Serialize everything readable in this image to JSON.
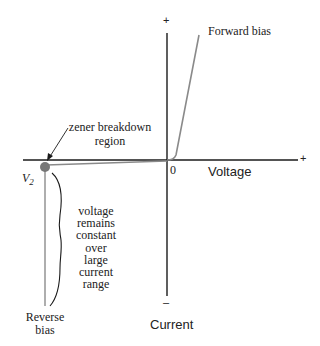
{
  "diagram": {
    "axes": {
      "x_label": "Voltage",
      "y_label": "Current",
      "x_plus": "+",
      "y_plus": "+",
      "y_minus": "–",
      "origin": "0"
    },
    "labels": {
      "forward_bias": "Forward bias",
      "reverse_bias_line1": "Reverse",
      "reverse_bias_line2": "bias",
      "zener_line1": "zener breakdown",
      "zener_line2": "region",
      "vz_symbol": "V",
      "vz_subscript": "2",
      "note_lines": [
        "voltage",
        "remains",
        "constant",
        "over",
        "large",
        "current",
        "range"
      ]
    },
    "colors": {
      "axis": "#1a1a1a",
      "curve": "#8a8a8a",
      "dot": "#777777",
      "text": "#222222"
    }
  }
}
